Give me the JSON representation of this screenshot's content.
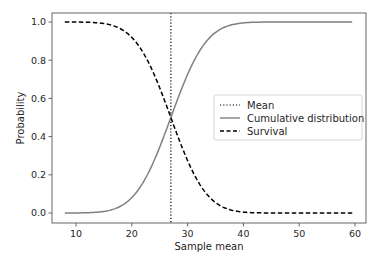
{
  "chart_data": {
    "type": "line",
    "title": "",
    "xlabel": "Sample mean",
    "ylabel": "Probability",
    "xlim": [
      5.5,
      61.5
    ],
    "ylim": [
      -0.05,
      1.05
    ],
    "xticks": [
      10,
      20,
      30,
      40,
      50,
      60
    ],
    "yticks": [
      0.0,
      0.2,
      0.4,
      0.6,
      0.8,
      1.0
    ],
    "xtick_labels": [
      "10",
      "20",
      "30",
      "40",
      "50",
      "60"
    ],
    "ytick_labels": [
      "0.0",
      "0.2",
      "0.4",
      "0.6",
      "0.8",
      "1.0"
    ],
    "grid": false,
    "legend_position": "center right",
    "mean": 27.0,
    "x": [
      8,
      10,
      12,
      14,
      16,
      18,
      20,
      22,
      24,
      26,
      27,
      28,
      30,
      32,
      34,
      36,
      38,
      40,
      42,
      44,
      46,
      48,
      50,
      52,
      54,
      56,
      58,
      59.5
    ],
    "series": [
      {
        "name": "Mean",
        "style": "dotted",
        "color": "#000000",
        "type": "vline",
        "x": 27.0
      },
      {
        "name": "Cumulative distribution",
        "style": "solid",
        "color": "#808080",
        "values": [
          0.0001,
          0.0003,
          0.0013,
          0.0047,
          0.0139,
          0.0359,
          0.0808,
          0.1587,
          0.2743,
          0.4207,
          0.5,
          0.5793,
          0.7257,
          0.8413,
          0.9192,
          0.9641,
          0.9861,
          0.9953,
          0.9987,
          0.9997,
          0.9999,
          1.0,
          1.0,
          1.0,
          1.0,
          1.0,
          1.0,
          1.0
        ]
      },
      {
        "name": "Survival",
        "style": "dashed",
        "color": "#000000",
        "values": [
          0.9999,
          0.9997,
          0.9987,
          0.9953,
          0.9861,
          0.9641,
          0.9192,
          0.8413,
          0.7257,
          0.5793,
          0.5,
          0.4207,
          0.2743,
          0.1587,
          0.0808,
          0.0359,
          0.0139,
          0.0047,
          0.0013,
          0.0003,
          0.0001,
          0.0,
          0.0,
          0.0,
          0.0,
          0.0,
          0.0,
          0.0
        ]
      }
    ]
  },
  "legend": {
    "items": [
      {
        "label": "Mean",
        "style": "dotted"
      },
      {
        "label": "Cumulative distribution",
        "style": "solid"
      },
      {
        "label": "Survival",
        "style": "dashed"
      }
    ]
  }
}
